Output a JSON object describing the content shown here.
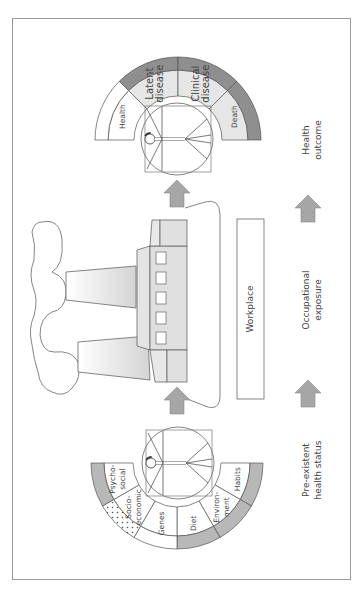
{
  "figure": {
    "orientation": "rotated-90-ccw",
    "colors": {
      "border": "#9a9a9a",
      "dark_band": "#8f8f8f",
      "mid_band": "#b8b8b8",
      "light_fill": "#e6e6e6",
      "arrow": "#a6a6a6",
      "line": "#555555"
    }
  },
  "outcome_ring": {
    "segments": [
      {
        "label": "Health",
        "fill": "#ffffff",
        "band": "#ffffff"
      },
      {
        "label": "Latent disease",
        "lines": [
          "Latent",
          "disease"
        ],
        "fill": "#e6e6e6",
        "band": "#8f8f8f"
      },
      {
        "label": "Clinical disease",
        "lines": [
          "Clinical",
          "disease"
        ],
        "fill": "#e6e6e6",
        "band": "#8f8f8f"
      },
      {
        "label": "Death",
        "fill": "#e6e6e6",
        "band": "#8f8f8f"
      }
    ]
  },
  "status_ring": {
    "segments": [
      {
        "label": "Psycho-social",
        "lines": [
          "Psycho-",
          "social"
        ],
        "band": "#b8b8b8"
      },
      {
        "label": "Socio-economic",
        "lines": [
          "Socio-",
          "economic"
        ],
        "band": "dotted"
      },
      {
        "label": "Genes",
        "lines": [
          "Genes"
        ],
        "band": "#ffffff"
      },
      {
        "label": "Diet",
        "lines": [
          "Diet"
        ],
        "band": "#b8b8b8"
      },
      {
        "label": "Environment",
        "lines": [
          "Environ-",
          "ment"
        ],
        "band": "#b8b8b8"
      },
      {
        "label": "Habits",
        "lines": [
          "Habits"
        ],
        "band": "#b8b8b8"
      }
    ]
  },
  "workplace": {
    "label": "Workplace"
  },
  "stage_labels": {
    "outcome": [
      "Health",
      "outcome"
    ],
    "exposure": [
      "Occupational",
      "exposure"
    ],
    "status": [
      "Pre-existent",
      "health status"
    ]
  }
}
